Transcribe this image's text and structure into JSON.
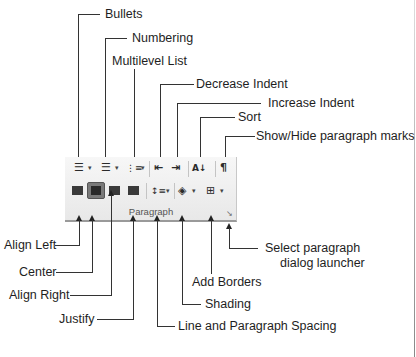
{
  "ribbon_group": {
    "label": "Paragraph",
    "row1": [
      {
        "name": "bullets",
        "icon": "bullets-icon",
        "glyph": "☰",
        "dropdown": true
      },
      {
        "name": "numbering",
        "icon": "numbering-icon",
        "glyph": "☰",
        "dropdown": true
      },
      {
        "name": "multilevel-list",
        "icon": "multilevel-list-icon",
        "glyph": "⋮≡",
        "dropdown": true
      },
      {
        "name": "decrease-indent",
        "icon": "decrease-indent-icon",
        "glyph": "⇤"
      },
      {
        "name": "increase-indent",
        "icon": "increase-indent-icon",
        "glyph": "⇥"
      },
      {
        "name": "sort",
        "icon": "sort-icon",
        "glyph": "A↓"
      },
      {
        "name": "show-hide",
        "icon": "pilcrow-icon",
        "glyph": "¶"
      }
    ],
    "row2": [
      {
        "name": "align-left",
        "icon": "align-left-icon"
      },
      {
        "name": "center",
        "icon": "align-center-icon",
        "selected": true
      },
      {
        "name": "align-right",
        "icon": "align-right-icon"
      },
      {
        "name": "justify",
        "icon": "justify-icon"
      },
      {
        "name": "line-spacing",
        "icon": "line-spacing-icon",
        "glyph": "↕≡",
        "dropdown": true
      },
      {
        "name": "shading",
        "icon": "shading-icon",
        "glyph": "◈",
        "dropdown": true
      },
      {
        "name": "borders",
        "icon": "borders-icon",
        "glyph": "⊞",
        "dropdown": true
      }
    ],
    "launcher_glyph": "↘",
    "dropdown_glyph": "▾"
  },
  "callouts": {
    "bullets": "Bullets",
    "numbering": "Numbering",
    "multilevel": "Multilevel List",
    "decrease_indent": "Decrease Indent",
    "increase_indent": "Increase Indent",
    "sort": "Sort",
    "show_hide": "Show/Hide paragraph marks",
    "align_left": "Align Left",
    "center": "Center",
    "align_right": "Align Right",
    "justify": "Justify",
    "line_spacing": "Line and Paragraph Spacing",
    "shading": "Shading",
    "add_borders": "Add Borders",
    "launcher_line1": "Select paragraph",
    "launcher_line2": "dialog launcher"
  }
}
